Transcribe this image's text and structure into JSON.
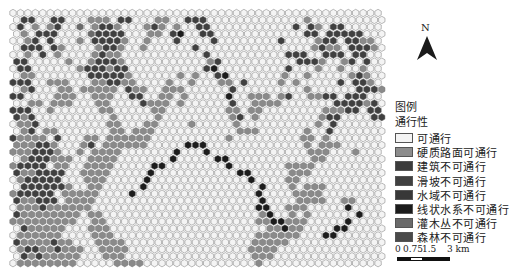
{
  "map": {
    "origin": [
      13,
      13
    ],
    "col_spacing": 7.45,
    "row_spacing": 6.95,
    "radius": 3.7,
    "rows": [
      "00000000000000000000000000000000000000000000000000",
      "03300330007770330007700333000000000000070000000000",
      "03070730060733700073707003300000000000303703300000",
      "07033300006333300077035002300000000000033033333000",
      "00730300070333370070003000030000000030000733033770",
      "03330370000733700700000030000000000000007377033370",
      "00703070000737700000000000300000000003330033303300",
      "33000007007333700000000000730000000000333700730300",
      "03300000073337330000000000350000000003000700700700",
      "07700000003333370000007070035000000070070000073700",
      "33300777000773377000070070007703000070700000303370",
      "07300077077777037700777000000300000000070000003337",
      "33000077700777003300770700000500777073007733033300",
      "00770777000770000377707000000300777700000003333730",
      "33300700000077000007700000000770770000000077733033",
      "37300000000007000007000000000730700000000733000033",
      "07730000000007700077000070000070000000000703000000",
      "07307700000007707770000000000077700000070030000000",
      "37777030007707777770000000000700000000077070000000",
      "77733700073077777700000555000000000000070777000000",
      "77733370070777700000005000500000000000007770007000",
      "07333777007777000000050000055000000000007700000000",
      "73333077007777000005500000000500000007777000000000",
      "37733330077770000050000000000055000007770000000000",
      "07333330007770000050000000000000500007700000000000",
      "03333337007700000500000000000000050007077700000000",
      "73333307777700005000000000000000050000777700000000",
      "37733307777000000000000000000000050000777700770000",
      "07773777777000000000000000000000055007770000050000",
      "37777777707700000000000000000000075007070000005000",
      "77777777700770000000000000000000077557770000050000",
      "03777770007770000000000000000000007757700005500000",
      "07777770000777000000000000000000077777700055000000",
      "37777377000777700000000000000000777770000000000000",
      "07337737770077770000000000000000777700000000000000",
      "03737777700077700000000000000000777000000000000000",
      "07777777700000777700000000000000070000000000000000"
    ],
    "palette": {
      "0": "#f4f4f4",
      "1": "#8c8c8c",
      "2": "#3c3c3c",
      "3": "#404040",
      "4": "#383838",
      "5": "#1c1c1c",
      "6": "#6a6a6a",
      "7": "#8a8a8a"
    }
  },
  "north_arrow": {
    "label": "N"
  },
  "legend": {
    "title": "图例",
    "subtitle": "通行性",
    "items": [
      {
        "label": "可通行",
        "color": "#f4f4f4"
      },
      {
        "label": "硬质路面可通行",
        "color": "#8c8c8c"
      },
      {
        "label": "建筑不可通行",
        "color": "#3c3c3c"
      },
      {
        "label": "滑坡不可通行",
        "color": "#404040"
      },
      {
        "label": "水域不可通行",
        "color": "#383838"
      },
      {
        "label": "线状水系不可通行",
        "color": "#1c1c1c"
      },
      {
        "label": "灌木丛不可通行",
        "color": "#6a6a6a"
      },
      {
        "label": "森林不可通行",
        "color": "#4a4a4a"
      }
    ]
  },
  "scale_bar": {
    "ticks": [
      "0",
      "0.75",
      "1.5",
      "3 km"
    ]
  }
}
